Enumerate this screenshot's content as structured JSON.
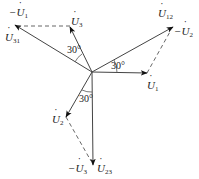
{
  "diagram": {
    "type": "phasor-diagram",
    "origin": {
      "x": 92,
      "y": 72
    },
    "colors": {
      "line": "#444444",
      "arrow": "#111111",
      "background": "#ffffff"
    },
    "phasors": [
      {
        "id": "U1",
        "label_sign": "",
        "label_sym": "U",
        "label_sub": "1",
        "tip": {
          "x": 147,
          "y": 73
        },
        "style": "solid"
      },
      {
        "id": "U2",
        "label_sign": "",
        "label_sym": "U",
        "label_sub": "2",
        "tip": {
          "x": 66,
          "y": 117
        },
        "style": "solid"
      },
      {
        "id": "U3",
        "label_sign": "",
        "label_sym": "U",
        "label_sub": "3",
        "tip": {
          "x": 70,
          "y": 27
        },
        "style": "solid"
      },
      {
        "id": "U12",
        "label_sign": "",
        "label_sym": "U",
        "label_sub": "12",
        "tip": {
          "x": 173,
          "y": 27
        },
        "style": "solid"
      },
      {
        "id": "U23",
        "label_sign": "",
        "label_sym": "U",
        "label_sub": "23",
        "tip": {
          "x": 93,
          "y": 165
        },
        "style": "solid"
      },
      {
        "id": "U31",
        "label_sign": "",
        "label_sym": "U",
        "label_sub": "31",
        "tip": {
          "x": 15,
          "y": 25
        },
        "style": "solid"
      }
    ],
    "dashed_segments": [
      {
        "from": "U3",
        "to": "U31",
        "represents": "-U1"
      },
      {
        "from": "U1",
        "to": "U12",
        "represents": "-U2"
      },
      {
        "from": "U2",
        "to": "U23",
        "represents": "-U3"
      }
    ],
    "labels": {
      "neg_u1": {
        "sign": "−",
        "sym": "U",
        "sub": "1"
      },
      "u31": {
        "sign": "",
        "sym": "U",
        "sub": "31"
      },
      "u3": {
        "sign": "",
        "sym": "U",
        "sub": "3"
      },
      "u12": {
        "sign": "",
        "sym": "U",
        "sub": "12"
      },
      "neg_u2": {
        "sign": "−",
        "sym": "U",
        "sub": "2"
      },
      "u1": {
        "sign": "",
        "sym": "U",
        "sub": "1"
      },
      "u2": {
        "sign": "",
        "sym": "U",
        "sub": "2"
      },
      "neg_u3": {
        "sign": "−",
        "sym": "U",
        "sub": "3"
      },
      "u23": {
        "sign": "",
        "sym": "U",
        "sub": "23"
      }
    },
    "angles": [
      {
        "text": "30°",
        "between": [
          "U3",
          "U31"
        ]
      },
      {
        "text": "30°",
        "between": [
          "U1",
          "U12"
        ]
      },
      {
        "text": "30°",
        "between": [
          "U2",
          "U23"
        ]
      }
    ]
  }
}
